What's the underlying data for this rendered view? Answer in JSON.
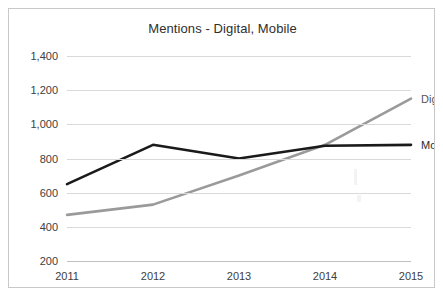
{
  "chart_data": {
    "type": "line",
    "title": "Mentions - Digital, Mobile",
    "xlabel": "",
    "ylabel": "",
    "categories": [
      "2011",
      "2012",
      "2013",
      "2014",
      "2015"
    ],
    "x": [
      2011,
      2012,
      2013,
      2014,
      2015
    ],
    "series": [
      {
        "name": "Digital",
        "color": "#9a9a9a",
        "values": [
          470,
          530,
          700,
          880,
          1150
        ],
        "label": "Digital"
      },
      {
        "name": "Mobile",
        "color": "#1a1a1a",
        "values": [
          650,
          880,
          800,
          875,
          880
        ],
        "label": "Mobile"
      }
    ],
    "ylim": [
      200,
      1400
    ],
    "ytick_values": [
      200,
      400,
      600,
      800,
      1000,
      1200,
      1400
    ],
    "ytick_labels": [
      "200",
      "400",
      "600",
      "800",
      "1,000",
      "1,200",
      "1,400"
    ],
    "grid": true,
    "legend": "inline-right-of-series",
    "border_color": "#c8c8c8",
    "gridline_color": "#d9d9d9",
    "background": "#ffffff"
  }
}
